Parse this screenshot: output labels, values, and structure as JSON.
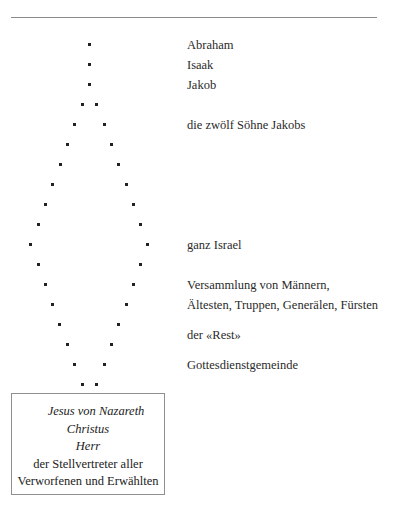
{
  "diagram": {
    "type": "genealogy-dot-diamond",
    "dot_rows": [
      {
        "y": 44,
        "x": [
          89
        ]
      },
      {
        "y": 64,
        "x": [
          89
        ]
      },
      {
        "y": 84,
        "x": [
          89
        ]
      },
      {
        "y": 104,
        "x": [
          82,
          96
        ]
      },
      {
        "y": 124,
        "x": [
          74,
          104
        ]
      },
      {
        "y": 144,
        "x": [
          67,
          111
        ]
      },
      {
        "y": 164,
        "x": [
          60,
          118
        ]
      },
      {
        "y": 184,
        "x": [
          52,
          126
        ]
      },
      {
        "y": 204,
        "x": [
          45,
          133
        ]
      },
      {
        "y": 224,
        "x": [
          38,
          140
        ]
      },
      {
        "y": 244,
        "x": [
          30,
          147
        ]
      },
      {
        "y": 264,
        "x": [
          38,
          140
        ]
      },
      {
        "y": 284,
        "x": [
          45,
          133
        ]
      },
      {
        "y": 304,
        "x": [
          52,
          126
        ]
      },
      {
        "y": 324,
        "x": [
          59,
          118
        ]
      },
      {
        "y": 344,
        "x": [
          67,
          111
        ]
      },
      {
        "y": 364,
        "x": [
          74,
          104
        ]
      },
      {
        "y": 384,
        "x": [
          82,
          96
        ]
      }
    ],
    "labels": [
      {
        "id": "abraham",
        "text": "Abraham",
        "y": 35
      },
      {
        "id": "isaak",
        "text": "Isaak",
        "y": 55
      },
      {
        "id": "jakob",
        "text": "Jakob",
        "y": 75
      },
      {
        "id": "soehne",
        "text": "die zwölf Söhne Jakobs",
        "y": 115
      },
      {
        "id": "israel",
        "text": "ganz Israel",
        "y": 235
      },
      {
        "id": "versammlung1",
        "text": "Versammlung von Männern,",
        "y": 275
      },
      {
        "id": "versammlung2",
        "text": "Ältesten, Truppen, Generälen, Fürsten",
        "y": 295
      },
      {
        "id": "rest",
        "text": "der «Rest»",
        "y": 325
      },
      {
        "id": "gemeinde",
        "text": "Gottesdienstgemeinde",
        "y": 355
      }
    ],
    "box": {
      "line1": "Jesus von Nazareth",
      "line2": "Christus",
      "line3": "Herr",
      "line4": "der Stellvertreter aller",
      "line5": "Verworfenen und Erwählten"
    }
  }
}
